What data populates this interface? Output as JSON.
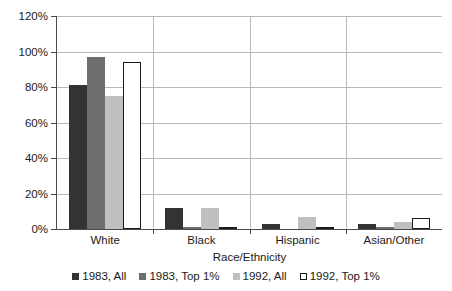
{
  "chart_data": {
    "type": "bar",
    "title": "",
    "xlabel": "Race/Ethnicity",
    "ylabel": "",
    "ylim": [
      0,
      120
    ],
    "ytick_labels": [
      "120%",
      "100%",
      "80%",
      "60%",
      "40%",
      "20%",
      "0%"
    ],
    "ytick_values": [
      120,
      100,
      80,
      60,
      40,
      20,
      0
    ],
    "grid": true,
    "legend_position": "bottom",
    "categories": [
      "White",
      "Black",
      "Hispanic",
      "Asian/Other"
    ],
    "series": [
      {
        "name": "1983, All",
        "color": "#333333",
        "values": [
          81,
          12,
          3,
          3
        ]
      },
      {
        "name": "1983, Top 1%",
        "color": "#6e6e6e",
        "values": [
          97,
          1,
          0,
          1
        ]
      },
      {
        "name": "1992, All",
        "color": "#bfbfbf",
        "values": [
          75,
          12,
          7,
          4
        ]
      },
      {
        "name": "1992, Top 1%",
        "color": "#ffffff",
        "values": [
          94,
          0.5,
          0,
          6
        ]
      }
    ]
  },
  "axis": {
    "x_title": "Race/Ethnicity"
  },
  "legend": {
    "items": [
      {
        "label": "1983, All"
      },
      {
        "label": "1983, Top 1%"
      },
      {
        "label": "1992, All"
      },
      {
        "label": "1992, Top 1%"
      }
    ]
  }
}
